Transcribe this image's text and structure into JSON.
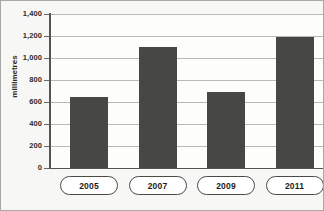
{
  "chart_data": {
    "type": "bar",
    "title": "",
    "xlabel": "",
    "ylabel": "millimetres",
    "categories": [
      "2005",
      "2007",
      "2009",
      "2011"
    ],
    "values": [
      645,
      1100,
      690,
      1190
    ],
    "ylim": [
      0,
      1400
    ],
    "ytick_step": 200,
    "ytick_labels": [
      "1,400",
      "1,200",
      "1,000",
      "800",
      "600",
      "400",
      "200",
      "0"
    ],
    "ytick_values": [
      1400,
      1200,
      1000,
      800,
      600,
      400,
      200,
      0
    ],
    "grid": true,
    "legend": null,
    "series": [
      {
        "name": "millimetres",
        "values": [
          645,
          1100,
          690,
          1190
        ]
      }
    ],
    "colors": {
      "bar": "#474744",
      "gridline": "#b9b9b5",
      "axis": "#55554f",
      "plot_background": "#fdfdfc",
      "page_background": "#f7f7f5",
      "text": "#2b2b28"
    }
  }
}
